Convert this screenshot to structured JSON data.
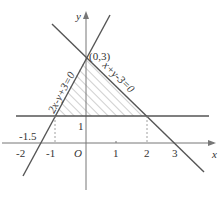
{
  "diagram": {
    "axes": {
      "x_label": "x",
      "y_label": "y",
      "origin_label": "O"
    },
    "x_ticks": [
      "-2",
      "-1",
      "1",
      "2",
      "3"
    ],
    "y_ticks": [
      "1"
    ],
    "extra_labels": {
      "neg_one_point_five": "-1.5"
    },
    "point_label": "(0,3)",
    "lines": [
      {
        "name": "line-2x-y+3",
        "equation": "2x-y+3=0"
      },
      {
        "name": "line-x+y-3",
        "equation": "x+y-3=0"
      },
      {
        "name": "line-y1",
        "equation": "y=1"
      }
    ],
    "region": {
      "vertices": [
        [
          0,
          3
        ],
        [
          -1,
          1
        ],
        [
          2,
          1
        ]
      ],
      "fill": "hatched"
    },
    "colors": {
      "line": "#555555",
      "axis": "#777777",
      "hatch": "#888888"
    }
  }
}
